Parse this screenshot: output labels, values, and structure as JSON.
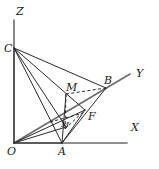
{
  "figure": {
    "stroke_color": "#2b2b2b",
    "axis_color": "#6b6b6b",
    "background": "#ffffff"
  },
  "axes": [
    {
      "name": "x-axis",
      "label": "X",
      "label_x": 131,
      "label_y": 122,
      "from": [
        14,
        143
      ],
      "to": [
        127,
        143
      ]
    },
    {
      "name": "y-axis",
      "label": "Y",
      "label_x": 136,
      "label_y": 68,
      "from": [
        14,
        143
      ],
      "to": [
        130,
        74
      ]
    },
    {
      "name": "z-axis",
      "label": "Z",
      "label_x": 16,
      "label_y": 6,
      "from": [
        14,
        143
      ],
      "to": [
        14,
        20
      ]
    }
  ],
  "points": [
    {
      "name": "origin-o",
      "label": "O",
      "x": 14,
      "y": 143,
      "label_x": 7,
      "label_y": 146,
      "size": "pt"
    },
    {
      "name": "point-a",
      "label": "A",
      "x": 62,
      "y": 143,
      "label_x": 58,
      "label_y": 146,
      "size": "pt"
    },
    {
      "name": "point-b",
      "label": "B",
      "x": 106,
      "y": 88,
      "label_x": 104,
      "label_y": 75,
      "size": "pt"
    },
    {
      "name": "point-c",
      "label": "C",
      "x": 14,
      "y": 48,
      "label_x": 4,
      "label_y": 43,
      "size": "pt"
    },
    {
      "name": "point-f",
      "label": "F",
      "x": 85,
      "y": 110,
      "label_x": 88,
      "label_y": 111,
      "size": "pt"
    },
    {
      "name": "point-m",
      "label": "M",
      "x": 66,
      "y": 94,
      "label_x": 66,
      "label_y": 82,
      "size": "pt"
    },
    {
      "name": "point-m1",
      "label": "M",
      "x": 65,
      "y": 129,
      "label_x": 61,
      "label_y": 121,
      "size": "sm"
    }
  ],
  "solid_segments": [
    {
      "name": "segment-c-o",
      "from": [
        14,
        48
      ],
      "to": [
        14,
        143
      ]
    },
    {
      "name": "segment-c-a",
      "from": [
        14,
        48
      ],
      "to": [
        62,
        143
      ]
    },
    {
      "name": "segment-c-m1",
      "from": [
        14,
        48
      ],
      "to": [
        66,
        127
      ]
    },
    {
      "name": "segment-c-f",
      "from": [
        14,
        48
      ],
      "to": [
        85,
        110
      ]
    },
    {
      "name": "segment-c-b",
      "from": [
        14,
        48
      ],
      "to": [
        106,
        88
      ]
    },
    {
      "name": "segment-o-a",
      "from": [
        14,
        143
      ],
      "to": [
        62,
        143
      ]
    },
    {
      "name": "segment-o-f",
      "from": [
        14,
        143
      ],
      "to": [
        85,
        110
      ]
    },
    {
      "name": "segment-o-m1",
      "from": [
        14,
        143
      ],
      "to": [
        66,
        127
      ]
    },
    {
      "name": "segment-a-b",
      "from": [
        62,
        143
      ],
      "to": [
        106,
        88
      ]
    },
    {
      "name": "segment-a-f",
      "from": [
        62,
        143
      ],
      "to": [
        85,
        110
      ]
    },
    {
      "name": "segment-a-m",
      "from": [
        62,
        143
      ],
      "to": [
        66,
        94
      ]
    }
  ],
  "dashed_segments": [
    {
      "name": "dashed-m-b",
      "from": [
        66,
        94
      ],
      "to": [
        106,
        88
      ]
    },
    {
      "name": "dashed-m-m1",
      "from": [
        66,
        94
      ],
      "to": [
        65,
        129
      ]
    },
    {
      "name": "dashed-m1-f",
      "from": [
        65,
        129
      ],
      "to": [
        85,
        110
      ]
    },
    {
      "name": "dashed-o-m1b",
      "from": [
        50,
        122
      ],
      "to": [
        80,
        114
      ]
    }
  ]
}
